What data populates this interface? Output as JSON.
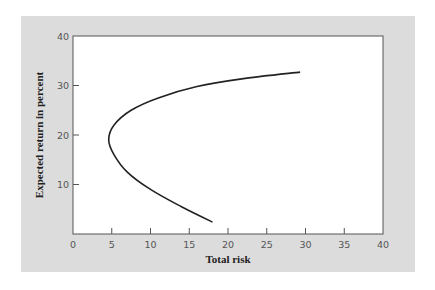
{
  "chart_data": {
    "type": "line",
    "title": "",
    "xlabel": "Total risk",
    "ylabel": "Expected return in percent",
    "xlim": [
      0,
      40
    ],
    "ylim": [
      0,
      40
    ],
    "x_ticks": [
      0,
      5,
      10,
      15,
      20,
      25,
      30,
      35,
      40
    ],
    "y_ticks": [
      10,
      20,
      30,
      40
    ],
    "grid": false,
    "legend": null,
    "series": [
      {
        "name": "Efficient frontier",
        "points": [
          {
            "x": 18.0,
            "y": 2.4
          },
          {
            "x": 14.0,
            "y": 5.5
          },
          {
            "x": 10.0,
            "y": 9.0
          },
          {
            "x": 7.0,
            "y": 12.5
          },
          {
            "x": 5.3,
            "y": 16.0
          },
          {
            "x": 4.6,
            "y": 19.0
          },
          {
            "x": 5.3,
            "y": 22.0
          },
          {
            "x": 7.5,
            "y": 25.0
          },
          {
            "x": 11.0,
            "y": 27.5
          },
          {
            "x": 16.0,
            "y": 29.8
          },
          {
            "x": 22.0,
            "y": 31.4
          },
          {
            "x": 29.3,
            "y": 32.7
          }
        ]
      }
    ]
  },
  "colors": {
    "panel_background": "#dcdcdc",
    "plot_background": "#ffffff",
    "curve": "#222222",
    "axis": "#555555"
  }
}
